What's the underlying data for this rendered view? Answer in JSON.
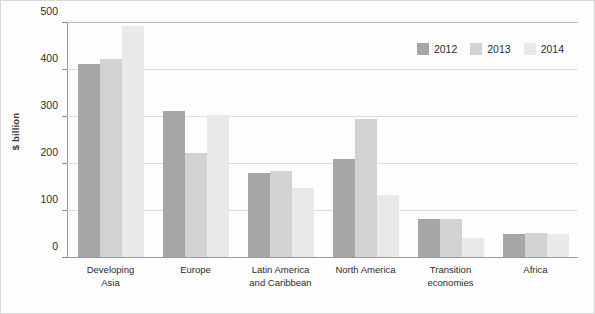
{
  "chart_data": {
    "type": "bar",
    "title": "",
    "xlabel": "",
    "ylabel": "$ billion",
    "ylim": [
      0,
      500
    ],
    "yticks": [
      0,
      100,
      200,
      300,
      400,
      500
    ],
    "ytick_labels": [
      "0",
      "100",
      "200",
      "300",
      "400",
      "500"
    ],
    "grid": true,
    "legend_position": "top-right",
    "categories": [
      "Developing Asia",
      "Europe",
      "Latin America and Caribbean",
      "North America",
      "Transition economies",
      "Africa"
    ],
    "category_lines": [
      [
        "Developing",
        "Asia"
      ],
      [
        "Europe"
      ],
      [
        "Latin America",
        "and Caribbean"
      ],
      [
        "North America"
      ],
      [
        "Transition",
        "economies"
      ],
      [
        "Africa"
      ]
    ],
    "series": [
      {
        "name": "2012",
        "color": "#a6a6a6",
        "values": [
          412,
          312,
          180,
          210,
          81,
          50
        ]
      },
      {
        "name": "2013",
        "color": "#d2d2d2",
        "values": [
          424,
          222,
          183,
          294,
          82,
          51
        ]
      },
      {
        "name": "2014",
        "color": "#e9e9e9",
        "values": [
          493,
          303,
          147,
          133,
          40,
          49
        ]
      }
    ]
  },
  "legend": {
    "items": [
      {
        "label": "2012",
        "color": "#a6a6a6"
      },
      {
        "label": "2013",
        "color": "#d2d2d2"
      },
      {
        "label": "2014",
        "color": "#e9e9e9"
      }
    ]
  }
}
